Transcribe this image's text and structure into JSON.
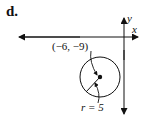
{
  "figure": {
    "part_label": "d.",
    "axes": {
      "x_label": "x",
      "y_label": "y"
    },
    "circle": {
      "center_label": "(−6, −9)",
      "radius_label": "r = 5",
      "center": [
        -6,
        -9
      ],
      "radius": 5
    }
  }
}
